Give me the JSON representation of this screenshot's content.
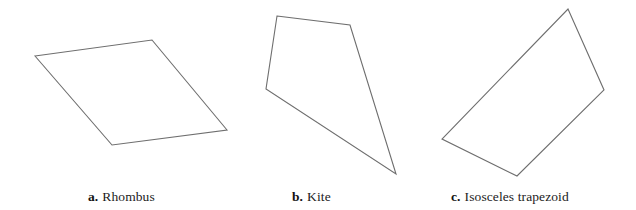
{
  "figure": {
    "width": 636,
    "height": 210,
    "background_color": "#ffffff",
    "stroke_color": "#6e6e6e",
    "fill_color": "#ffffff",
    "stroke_width": 1.1,
    "caption_color": "#1c1c1c"
  },
  "items": [
    {
      "letter": "a.",
      "name": "Rhombus",
      "points": "35,56 152,40 227,130 112,145"
    },
    {
      "letter": "b.",
      "name": "Kite",
      "points": "277,16 350,25 396,174 266,89"
    },
    {
      "letter": "c.",
      "name": "Isosceles trapezoid",
      "points": "568,9 604,90 517,176 442,139"
    }
  ]
}
